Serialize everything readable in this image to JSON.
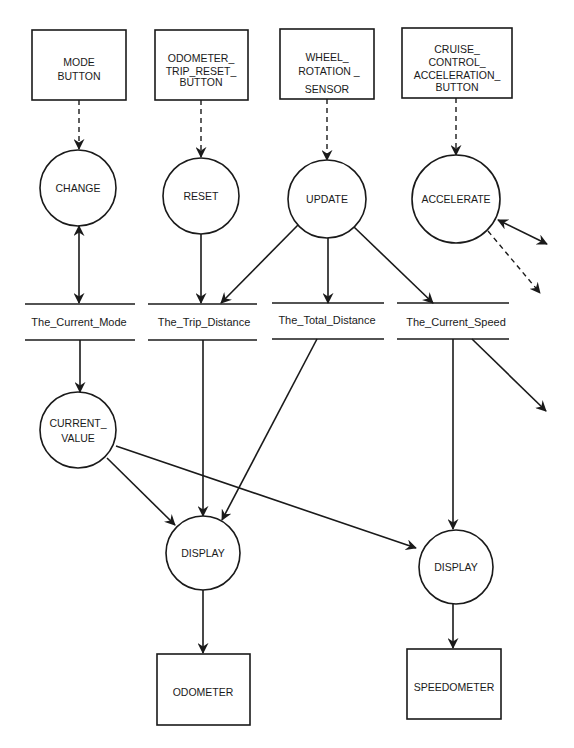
{
  "diagram": {
    "type": "data-flow-diagram",
    "terminators": [
      {
        "id": "mode_button",
        "lines": [
          "MODE",
          "BUTTON"
        ]
      },
      {
        "id": "odometer_trip_reset_button",
        "lines": [
          "ODOMETER_",
          "TRIP_RESET_",
          "BUTTON"
        ]
      },
      {
        "id": "wheel_rotation_sensor",
        "lines": [
          "WHEEL_",
          "ROTATION _",
          "SENSOR"
        ]
      },
      {
        "id": "cruise_control_acceleration_button",
        "lines": [
          "CRUISE_",
          "CONTROL_",
          "ACCELERATION_",
          "BUTTON"
        ]
      },
      {
        "id": "odometer",
        "lines": [
          "ODOMETER"
        ]
      },
      {
        "id": "speedometer",
        "lines": [
          "SPEEDOMETER"
        ]
      }
    ],
    "processes": [
      {
        "id": "change",
        "lines": [
          "CHANGE"
        ]
      },
      {
        "id": "reset",
        "lines": [
          "RESET"
        ]
      },
      {
        "id": "update",
        "lines": [
          "UPDATE"
        ]
      },
      {
        "id": "accelerate",
        "lines": [
          "ACCELERATE"
        ]
      },
      {
        "id": "current_value",
        "lines": [
          "CURRENT_",
          "VALUE"
        ]
      },
      {
        "id": "display_odometer",
        "lines": [
          "DISPLAY"
        ]
      },
      {
        "id": "display_speedometer",
        "lines": [
          "DISPLAY"
        ]
      }
    ],
    "data_stores": [
      {
        "id": "current_mode",
        "label": "The_Current_Mode"
      },
      {
        "id": "trip_distance",
        "label": "The_Trip_Distance"
      },
      {
        "id": "total_distance",
        "label": "The_Total_Distance"
      },
      {
        "id": "current_speed",
        "label": "The_Current_Speed"
      }
    ],
    "flows": [
      {
        "from": "mode_button",
        "to": "change",
        "style": "dashed"
      },
      {
        "from": "odometer_trip_reset_button",
        "to": "reset",
        "style": "dashed"
      },
      {
        "from": "wheel_rotation_sensor",
        "to": "update",
        "style": "dashed"
      },
      {
        "from": "cruise_control_acceleration_button",
        "to": "accelerate",
        "style": "dashed"
      },
      {
        "from": "change",
        "to": "current_mode",
        "style": "solid",
        "bidirectional": true
      },
      {
        "from": "reset",
        "to": "trip_distance",
        "style": "solid"
      },
      {
        "from": "update",
        "to": "trip_distance",
        "style": "solid"
      },
      {
        "from": "update",
        "to": "total_distance",
        "style": "solid"
      },
      {
        "from": "update",
        "to": "current_speed",
        "style": "solid"
      },
      {
        "from": "accelerate",
        "to": "offpage",
        "style": "solid",
        "bidirectional": true
      },
      {
        "from": "accelerate",
        "to": "offpage",
        "style": "dashed"
      },
      {
        "from": "current_speed",
        "to": "offpage",
        "style": "solid"
      },
      {
        "from": "current_mode",
        "to": "current_value",
        "style": "solid"
      },
      {
        "from": "current_value",
        "to": "display_odometer",
        "style": "solid"
      },
      {
        "from": "current_value",
        "to": "display_speedometer",
        "style": "solid"
      },
      {
        "from": "trip_distance",
        "to": "display_odometer",
        "style": "solid"
      },
      {
        "from": "total_distance",
        "to": "display_odometer",
        "style": "solid"
      },
      {
        "from": "current_speed",
        "to": "display_speedometer",
        "style": "solid"
      },
      {
        "from": "display_odometer",
        "to": "odometer",
        "style": "solid"
      },
      {
        "from": "display_speedometer",
        "to": "speedometer",
        "style": "solid"
      }
    ]
  }
}
